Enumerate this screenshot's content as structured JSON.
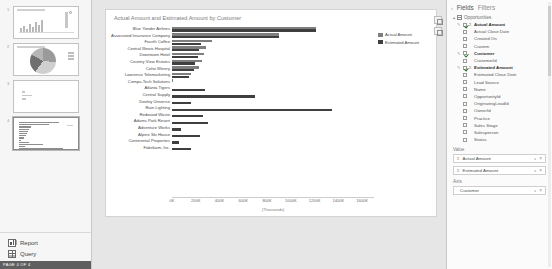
{
  "app": {
    "status_text": "PAGE 4 OF 4"
  },
  "pages_pane": {
    "thumbnails": [
      {
        "number": "1",
        "kind": "line-and-bar",
        "selected": false
      },
      {
        "number": "2",
        "kind": "pie",
        "selected": false
      },
      {
        "number": "3",
        "kind": "text",
        "selected": false
      },
      {
        "number": "4",
        "kind": "bar",
        "selected": true
      }
    ],
    "footer": [
      {
        "label": "Report",
        "icon": "report-icon"
      },
      {
        "label": "Query",
        "icon": "query-icon"
      }
    ]
  },
  "chart_data": {
    "type": "bar",
    "title": "Actual Amount and Estimated Amount by Customer",
    "orientation": "horizontal",
    "xlabel": "(Thousands)",
    "ylabel": "",
    "xlim": [
      0,
      1700
    ],
    "grid": false,
    "legend_position": "right",
    "tick_labels": [
      "0K",
      "200K",
      "400K",
      "600K",
      "800K",
      "1000K",
      "1200K",
      "1400K",
      "1600K"
    ],
    "tick_values": [
      0,
      200,
      400,
      600,
      800,
      1000,
      1200,
      1400,
      1600
    ],
    "categories": [
      "Blue Yonder Airlines",
      "Associated Insurance Company",
      "Fourth Coffee",
      "Central Illinois Hospital",
      "Downtown Hotel",
      "Country View Estates",
      "Coho Winery",
      "Lawrence Telemarketing",
      "Compu-Tech Solutions",
      "Atlanta Tigers",
      "Central Supply",
      "Dooley Universe",
      "Rain Lighting",
      "Redwood Waste",
      "Adams Park Resort",
      "Adventure Works",
      "Alpine Ski House",
      "Continental Properties",
      "Fabrikam, Inc."
    ],
    "series": [
      {
        "name": "Actual Amount",
        "color": "#7e7e7e",
        "values": [
          1210,
          900,
          340,
          290,
          270,
          250,
          225,
          160,
          8,
          0,
          0,
          0,
          0,
          0,
          0,
          0,
          0,
          0,
          0
        ]
      },
      {
        "name": "Estimated Amount",
        "color": "#3f3f3f",
        "values": [
          1215,
          900,
          240,
          230,
          215,
          190,
          185,
          140,
          0,
          275,
          700,
          160,
          1350,
          265,
          300,
          75,
          235,
          60,
          160
        ]
      }
    ]
  },
  "visual_buttons": [
    {
      "name": "focus-mode-button"
    },
    {
      "name": "filter-button"
    }
  ],
  "fields_pane": {
    "caret": "›",
    "tabs": [
      {
        "label": "Fields",
        "active": true
      },
      {
        "label": "Filters",
        "active": false
      }
    ],
    "table": {
      "caret": "▴",
      "name": "Opportunities",
      "fields": [
        {
          "label": "Actual Amount",
          "checked": true,
          "bold": true,
          "sigma": true,
          "pencil": true
        },
        {
          "label": "Actual Close Date",
          "checked": false,
          "bold": false,
          "sigma": false,
          "pencil": false
        },
        {
          "label": "Created On",
          "checked": false,
          "bold": false,
          "sigma": false,
          "pencil": false
        },
        {
          "label": "Custom",
          "checked": false,
          "bold": false,
          "sigma": false,
          "pencil": false
        },
        {
          "label": "Customer",
          "checked": true,
          "bold": true,
          "sigma": false,
          "pencil": true
        },
        {
          "label": "CustomerId",
          "checked": false,
          "bold": false,
          "sigma": false,
          "pencil": false
        },
        {
          "label": "Estimated Amount",
          "checked": true,
          "bold": true,
          "sigma": true,
          "pencil": true
        },
        {
          "label": "Estimated Close Date",
          "checked": false,
          "bold": false,
          "sigma": false,
          "pencil": false
        },
        {
          "label": "Lead Source",
          "checked": false,
          "bold": false,
          "sigma": false,
          "pencil": false
        },
        {
          "label": "Name",
          "checked": false,
          "bold": false,
          "sigma": false,
          "pencil": false
        },
        {
          "label": "OpportunityId",
          "checked": false,
          "bold": false,
          "sigma": false,
          "pencil": false
        },
        {
          "label": "OriginatingLeadId",
          "checked": false,
          "bold": false,
          "sigma": false,
          "pencil": false
        },
        {
          "label": "OwnerId",
          "checked": false,
          "bold": false,
          "sigma": false,
          "pencil": false
        },
        {
          "label": "Practice",
          "checked": false,
          "bold": false,
          "sigma": false,
          "pencil": false
        },
        {
          "label": "Sales Stage",
          "checked": false,
          "bold": false,
          "sigma": false,
          "pencil": false
        },
        {
          "label": "Salesperson",
          "checked": false,
          "bold": false,
          "sigma": false,
          "pencil": false
        },
        {
          "label": "Status",
          "checked": false,
          "bold": false,
          "sigma": false,
          "pencil": false
        }
      ]
    },
    "wells": [
      {
        "title": "Value",
        "chips": [
          {
            "label": "Actual Amount",
            "sigma": "Σ",
            "caret": "˅",
            "close": "×"
          },
          {
            "label": "Estimated Amount",
            "sigma": "Σ",
            "caret": "˅",
            "close": "×"
          }
        ]
      },
      {
        "title": "Axis",
        "chips": [
          {
            "label": "Customer",
            "sigma": "",
            "caret": "˅",
            "close": "×"
          }
        ]
      }
    ]
  }
}
